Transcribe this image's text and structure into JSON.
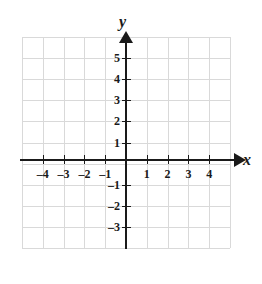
{
  "chart_data": {
    "type": "scatter",
    "title": "",
    "xlabel": "x",
    "ylabel": "y",
    "xlim": [
      -5,
      5
    ],
    "ylim": [
      -4,
      6
    ],
    "grid": true,
    "legend": null,
    "series": [],
    "annotations": [],
    "x_ticks": [
      {
        "value": -4,
        "label": "–4"
      },
      {
        "value": -3,
        "label": "–3"
      },
      {
        "value": -2,
        "label": "–2"
      },
      {
        "value": -1,
        "label": "–1"
      },
      {
        "value": 1,
        "label": "1"
      },
      {
        "value": 2,
        "label": "2"
      },
      {
        "value": 3,
        "label": "3"
      },
      {
        "value": 4,
        "label": "4"
      }
    ],
    "y_ticks": [
      {
        "value": 5,
        "label": "5"
      },
      {
        "value": 4,
        "label": "4"
      },
      {
        "value": 3,
        "label": "3"
      },
      {
        "value": 2,
        "label": "2"
      },
      {
        "value": 1,
        "label": "1"
      },
      {
        "value": -1,
        "label": "–1"
      },
      {
        "value": -2,
        "label": "–2"
      },
      {
        "value": -3,
        "label": "–3"
      }
    ],
    "colors": {
      "grid": "#d9d9d9",
      "axis": "#1a1a1a",
      "text": "#1a1a1a",
      "background": "#ffffff"
    }
  }
}
